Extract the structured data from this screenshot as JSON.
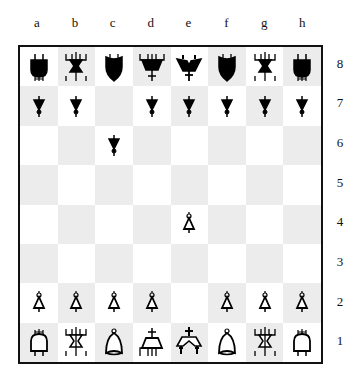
{
  "board": {
    "files": [
      "a",
      "b",
      "c",
      "d",
      "e",
      "f",
      "g",
      "h"
    ],
    "ranks": [
      "8",
      "7",
      "6",
      "5",
      "4",
      "3",
      "2",
      "1"
    ],
    "colors": {
      "light": "#ffffff",
      "dark": "#ececec",
      "border": "#111111",
      "black_piece": "#000000",
      "white_piece": "#ffffff"
    },
    "position": [
      [
        "bR",
        "bN",
        "bB",
        "bQ",
        "bK",
        "bB",
        "bN",
        "bR"
      ],
      [
        "bP",
        "bP",
        "",
        "bP",
        "bP",
        "bP",
        "bP",
        "bP"
      ],
      [
        "",
        "",
        "bP",
        "",
        "",
        "",
        "",
        ""
      ],
      [
        "",
        "",
        "",
        "",
        "",
        "",
        "",
        ""
      ],
      [
        "",
        "",
        "",
        "",
        "wP",
        "",
        "",
        ""
      ],
      [
        "",
        "",
        "",
        "",
        "",
        "",
        "",
        ""
      ],
      [
        "wP",
        "wP",
        "wP",
        "wP",
        "",
        "wP",
        "wP",
        "wP"
      ],
      [
        "wR",
        "wN",
        "wB",
        "wQ",
        "wK",
        "wB",
        "wN",
        "wR"
      ]
    ],
    "piece_names": {
      "R": "rook (AND-gate glyph)",
      "N": "knight (hourglass-gate glyph)",
      "B": "bishop (OR-gate glyph)",
      "Q": "queen (trapezoid-gate glyph)",
      "K": "king (double-gate glyph with cross)",
      "P": "pawn (buffer-gate glyph)"
    }
  }
}
